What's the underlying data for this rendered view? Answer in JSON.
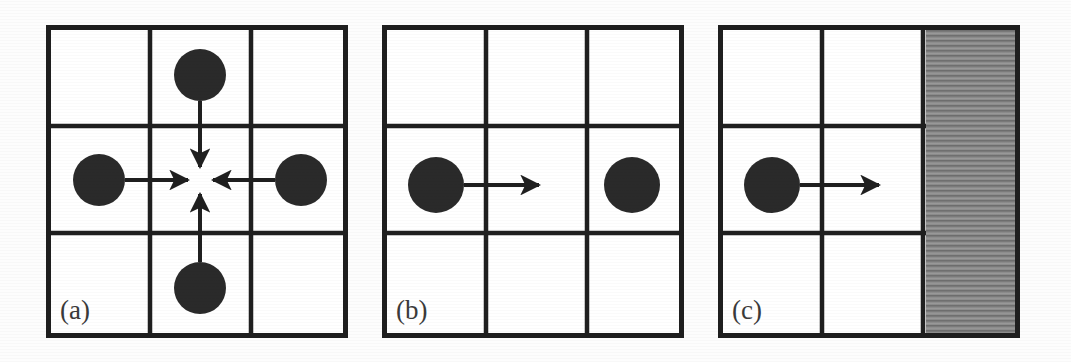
{
  "figure": {
    "type": "diagram",
    "background_color": "#fdfdfd",
    "ink_color": "#1f1f1f",
    "wall_color": "#8a8a8a",
    "caption_color": "#3a3a3a",
    "panels": [
      {
        "id": "a",
        "caption": "(a)",
        "grid": {
          "rows": 3,
          "cols": 3,
          "x": 46,
          "y": 25,
          "width": 302,
          "height": 313
        },
        "circles": [
          {
            "name": "top-particle",
            "cx": 154,
            "cy": 50,
            "r": 26
          },
          {
            "name": "left-particle",
            "cx": 53,
            "cy": 155,
            "r": 26
          },
          {
            "name": "right-particle",
            "cx": 255,
            "cy": 155,
            "r": 26
          },
          {
            "name": "bottom-particle",
            "cx": 154,
            "cy": 263,
            "r": 26
          }
        ],
        "arrows": [
          {
            "name": "arrow-down",
            "x1": 154,
            "y1": 78,
            "x2": 154,
            "y2": 143,
            "direction": "down"
          },
          {
            "name": "arrow-right",
            "x1": 80,
            "y1": 155,
            "x2": 143,
            "y2": 155,
            "direction": "right"
          },
          {
            "name": "arrow-left",
            "x1": 228,
            "y1": 155,
            "x2": 166,
            "y2": 155,
            "direction": "left"
          },
          {
            "name": "arrow-up",
            "x1": 154,
            "y1": 235,
            "x2": 154,
            "y2": 168,
            "direction": "up"
          }
        ],
        "shaded_column": null
      },
      {
        "id": "b",
        "caption": "(b)",
        "grid": {
          "rows": 3,
          "cols": 3,
          "x": 382,
          "y": 25,
          "width": 302,
          "height": 313
        },
        "circles": [
          {
            "name": "moving-particle",
            "cx": 54,
            "cy": 160,
            "r": 28
          },
          {
            "name": "target-particle",
            "cx": 250,
            "cy": 160,
            "r": 28
          }
        ],
        "arrows": [
          {
            "name": "arrow-right",
            "x1": 82,
            "y1": 160,
            "x2": 158,
            "y2": 160,
            "direction": "right"
          }
        ],
        "shaded_column": null
      },
      {
        "id": "c",
        "caption": "(c)",
        "grid": {
          "rows": 3,
          "cols": 3,
          "x": 718,
          "y": 25,
          "width": 302,
          "height": 313
        },
        "circles": [
          {
            "name": "moving-particle",
            "cx": 54,
            "cy": 160,
            "r": 28
          }
        ],
        "arrows": [
          {
            "name": "arrow-right",
            "x1": 82,
            "y1": 160,
            "x2": 162,
            "y2": 160,
            "direction": "right"
          }
        ],
        "shaded_column": {
          "name": "solid-wall-column",
          "x": 210,
          "width": 92,
          "fill": "#8a8a8a",
          "pattern": "horizontal-hatch"
        }
      }
    ]
  }
}
